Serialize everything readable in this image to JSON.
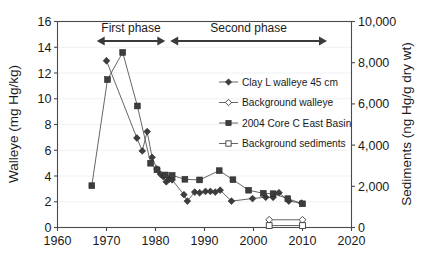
{
  "figure": {
    "background_color": "#ffffff",
    "line_color": "#555555",
    "marker_color": "#3d3d3d",
    "grid_color": "#ededf2"
  },
  "annotations": [
    {
      "name": "first-phase",
      "label": "First phase",
      "x_start": 1968,
      "x_end": 1982
    },
    {
      "name": "second-phase",
      "label": "Second phase",
      "x_start": 1983,
      "x_end": 2015
    }
  ],
  "legend": {
    "position": "center-right-upper",
    "entries": [
      {
        "label": "Clay L walleye 45 cm",
        "marker": "filled-diamond",
        "line": true
      },
      {
        "label": "Background walleye",
        "marker": "open-diamond",
        "line": true
      },
      {
        "label": "2004 Core C East Basin",
        "marker": "filled-square",
        "line": true
      },
      {
        "label": "Background sediments",
        "marker": "open-square",
        "line": true
      }
    ]
  },
  "chart_data": {
    "type": "line",
    "title": "",
    "xlabel": "",
    "ylabel": "Walleye (mg Hg/kg)",
    "y2label": "Sediments (ng Hg/g dry wt)",
    "xlim": [
      1960,
      2020
    ],
    "xticks": [
      1960,
      1970,
      1980,
      1990,
      2000,
      2010,
      2020
    ],
    "xticklabels": [
      "1960",
      "1970",
      "1980",
      "1990",
      "2000",
      "2010",
      "2020"
    ],
    "ylim": [
      0,
      16
    ],
    "yticks": [
      0,
      2,
      4,
      6,
      8,
      10,
      12,
      14,
      16
    ],
    "yticklabels": [
      "0",
      "2",
      "4",
      "6",
      "8",
      "10",
      "12",
      "14",
      "16"
    ],
    "y2lim": [
      0,
      10000
    ],
    "y2ticks": [
      0,
      2000,
      4000,
      6000,
      8000,
      10000
    ],
    "y2ticklabels": [
      "0",
      "2,000",
      "4,000",
      "6,000",
      "8,000",
      "10,000"
    ],
    "grid": true,
    "legend_position": "center-right",
    "series": [
      {
        "name": "Clay L walleye 45 cm",
        "axis": "left",
        "marker": "filled-diamond",
        "units": "mg Hg/kg",
        "points": [
          [
            1970.0,
            12.95
          ],
          [
            1976.2,
            6.95
          ],
          [
            1977.3,
            5.95
          ],
          [
            1978.3,
            7.45
          ],
          [
            1979.3,
            5.45
          ],
          [
            1980.3,
            4.55
          ],
          [
            1981.0,
            4.15
          ],
          [
            1981.6,
            3.95
          ],
          [
            1982.2,
            3.55
          ],
          [
            1982.8,
            3.75
          ],
          [
            1983.4,
            3.7
          ],
          [
            1985.8,
            2.55
          ],
          [
            1986.5,
            2.05
          ],
          [
            1988.0,
            2.75
          ],
          [
            1989.0,
            2.7
          ],
          [
            1990.2,
            2.8
          ],
          [
            1991.2,
            2.8
          ],
          [
            1992.2,
            2.75
          ],
          [
            1993.2,
            2.9
          ],
          [
            1995.5,
            2.05
          ],
          [
            1999.8,
            2.25
          ],
          [
            2002.5,
            2.35
          ],
          [
            2004.0,
            2.35
          ],
          [
            2005.2,
            2.7
          ],
          [
            2007.2,
            2.05
          ],
          [
            2009.8,
            1.9
          ]
        ]
      },
      {
        "name": "2004 Core C East Basin",
        "axis": "right",
        "marker": "filled-square",
        "units": "ng Hg/g dry wt",
        "points": [
          [
            1967.0,
            2030
          ],
          [
            1970.2,
            7180
          ],
          [
            1973.3,
            8500
          ],
          [
            1976.3,
            5900
          ],
          [
            1979.0,
            3120
          ],
          [
            1980.3,
            2800
          ],
          [
            1982.0,
            2550
          ],
          [
            1983.4,
            2530
          ],
          [
            1986.0,
            2340
          ],
          [
            1989.0,
            2310
          ],
          [
            1993.0,
            2760
          ],
          [
            1995.8,
            2320
          ],
          [
            1999.0,
            1810
          ],
          [
            2002.0,
            1660
          ],
          [
            2004.0,
            1640
          ],
          [
            2007.0,
            1400
          ],
          [
            2010.0,
            1150
          ]
        ]
      },
      {
        "name": "Background walleye",
        "axis": "left",
        "marker": "open-diamond",
        "units": "mg Hg/kg",
        "points": [
          [
            2003.2,
            0.6
          ],
          [
            2010.0,
            0.6
          ]
        ]
      },
      {
        "name": "Background sediments",
        "axis": "right",
        "marker": "open-square",
        "units": "ng Hg/g dry wt",
        "points": [
          [
            2003.2,
            95
          ],
          [
            2010.0,
            95
          ]
        ]
      }
    ]
  }
}
